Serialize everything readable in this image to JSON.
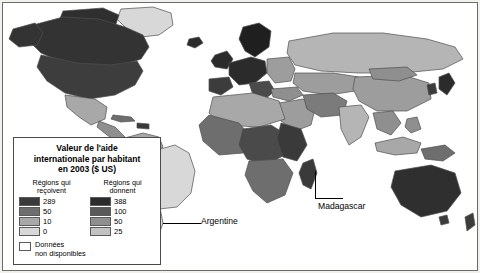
{
  "map": {
    "title": "Valeur de l'aide internationale en 2003 ($ US) par habitant",
    "legend": {
      "title": "Valeur de l'aide internationale par habitant en 2003 ($ US)",
      "title_line1": "Valeur de l'aide",
      "title_line2": "internationale par habitant",
      "title_line3": "en 2003 ($ US)",
      "receiving_header_line1": "Régions qui",
      "receiving_header_line2": "reçoivent",
      "giving_header_line1": "Régions qui",
      "giving_header_line2": "donnent",
      "receiving_classes": [
        {
          "label": "289",
          "color": "#3a3a3a"
        },
        {
          "label": "50",
          "color": "#6e6e6e"
        },
        {
          "label": "10",
          "color": "#a8a8a8"
        },
        {
          "label": "0",
          "color": "#d8d8d8"
        }
      ],
      "giving_classes": [
        {
          "label": "388",
          "color": "#2b2b2b"
        },
        {
          "label": "100",
          "color": "#595959"
        },
        {
          "label": "50",
          "color": "#8f8f8f"
        },
        {
          "label": "25",
          "color": "#c2c2c2"
        }
      ],
      "no_data_label_line1": "Données",
      "no_data_label_line2": "non disponibles",
      "no_data_color": "#ffffff"
    },
    "annotations": [
      {
        "name": "argentine",
        "label": "Argentine"
      },
      {
        "name": "madagascar",
        "label": "Madagascar"
      }
    ],
    "colors": {
      "border": "#6b6b6b",
      "ocean": "#ffffff",
      "country_outline": "#4f4f4f"
    }
  }
}
